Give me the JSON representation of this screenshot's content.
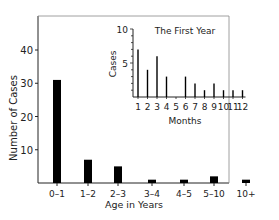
{
  "chart_data": [
    {
      "type": "bar",
      "title": "",
      "xlabel": "Age in Years",
      "ylabel": "Number of Cases",
      "categories": [
        "0–1",
        "1–2",
        "2–3",
        "3–4",
        "4–5",
        "5–10",
        "10+"
      ],
      "values": [
        31,
        7,
        5,
        1,
        1,
        2,
        1
      ],
      "yticks": [
        10,
        20,
        30,
        40
      ],
      "ylim": [
        0,
        50
      ],
      "grid": false,
      "legend": null
    },
    {
      "type": "bar",
      "title": "The First Year",
      "xlabel": "Months",
      "ylabel": "Cases",
      "categories": [
        "1",
        "2",
        "3",
        "4",
        "5",
        "6",
        "7",
        "8",
        "9",
        "10",
        "11",
        "12"
      ],
      "values": [
        7,
        4,
        6,
        3,
        0,
        3,
        2,
        1,
        2,
        1,
        1,
        1
      ],
      "yticks": [
        5,
        10
      ],
      "ylim": [
        0,
        10
      ],
      "grid": false,
      "inset": true
    }
  ]
}
